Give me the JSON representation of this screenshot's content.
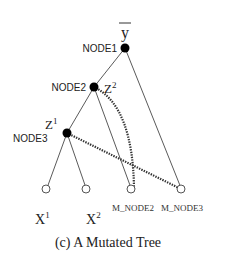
{
  "figure": {
    "caption": "(c) A Mutated Tree",
    "root_symbol": "y",
    "nodes": {
      "node1": {
        "label": "NODE1"
      },
      "node2": {
        "label": "NODE2",
        "var": "Z",
        "sup": "2"
      },
      "node3": {
        "label": "NODE3",
        "var": "Z",
        "sup": "1"
      }
    },
    "leaves": [
      {
        "var": "X",
        "sup": "1"
      },
      {
        "var": "X",
        "sup": "2"
      },
      {
        "label": "M_NODE2"
      },
      {
        "label": "M_NODE3"
      }
    ],
    "colors": {
      "line": "#555555",
      "node_fill": "#000000",
      "leaf_stroke": "#555555"
    }
  }
}
